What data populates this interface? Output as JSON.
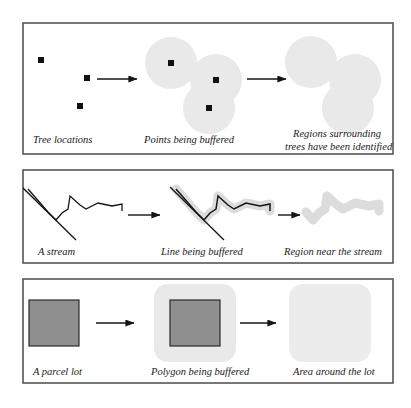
{
  "figure": {
    "frame_color": "#555555",
    "buffer_fill": "#e9e9e9",
    "parcel_fill": "#8f8f8f",
    "ink_color": "#1a1a1a",
    "background": "#ffffff"
  },
  "panels": [
    {
      "id": "point-buffer",
      "name": "Point buffer row",
      "stages": [
        {
          "id": "tree-locations",
          "caption": "Tree locations",
          "caption_lines": [
            "Tree locations"
          ],
          "feature_type": "point",
          "points": [
            {
              "x": 41,
              "y": 60,
              "size": 6
            },
            {
              "x": 87,
              "y": 78,
              "size": 6
            },
            {
              "x": 80,
              "y": 106,
              "size": 6
            }
          ]
        },
        {
          "id": "points-being-buffered",
          "caption": "Points being buffered",
          "caption_lines": [
            "Points being buffered"
          ],
          "feature_type": "point-with-buffer",
          "buffer_radius": 26,
          "points": [
            {
              "x": 171,
              "y": 63,
              "size": 6
            },
            {
              "x": 216,
              "y": 80,
              "size": 6
            },
            {
              "x": 209,
              "y": 108,
              "size": 6
            }
          ]
        },
        {
          "id": "regions-surrounding-trees",
          "caption": "Regions surrounding trees have been identified",
          "caption_lines": [
            "Regions surrounding",
            "trees have been identified"
          ],
          "feature_type": "buffer-only",
          "buffer_radius": 26,
          "points": [
            {
              "x": 311,
              "y": 62,
              "size": 0
            },
            {
              "x": 355,
              "y": 80,
              "size": 0
            },
            {
              "x": 348,
              "y": 108,
              "size": 0
            }
          ]
        }
      ],
      "arrows": [
        {
          "x1": 97,
          "y1": 79,
          "x2": 137,
          "y2": 79
        },
        {
          "x1": 247,
          "y1": 79,
          "x2": 286,
          "y2": 79
        }
      ]
    },
    {
      "id": "line-buffer",
      "name": "Line buffer row",
      "stages": [
        {
          "id": "a-stream",
          "caption": "A stream",
          "caption_lines": [
            "A stream"
          ],
          "feature_type": "line",
          "main_line": "28,189 48,212 56,220 62,213 68,209 70,196 80,205 86,209 98,203 112,206 122,204 122,211",
          "branch_line": "22,187 76,240"
        },
        {
          "id": "line-being-buffered",
          "caption": "Line being buffered",
          "caption_lines": [
            "Line being buffered"
          ],
          "feature_type": "line-with-buffer",
          "buffer_width": 9,
          "main_line": "176,189 196,212 204,220 210,213 216,209 218,196 228,205 234,209 246,203 260,206 270,204 270,211",
          "branch_line": "170,187 224,240"
        },
        {
          "id": "region-near-stream",
          "caption": "Region near the stream",
          "caption_lines": [
            "Region near the stream"
          ],
          "feature_type": "buffer-only-line",
          "buffer_width": 9,
          "main_line": "306,212 313,220 319,213 325,209 327,196 337,205 343,209 355,203 369,206 379,204 379,211"
        }
      ],
      "arrows": [
        {
          "x1": 128,
          "y1": 215,
          "x2": 160,
          "y2": 215
        },
        {
          "x1": 278,
          "y1": 215,
          "x2": 300,
          "y2": 215
        }
      ]
    },
    {
      "id": "polygon-buffer",
      "name": "Polygon buffer row",
      "stages": [
        {
          "id": "a-parcel-lot",
          "caption": "A parcel lot",
          "caption_lines": [
            "A parcel lot"
          ],
          "feature_type": "polygon",
          "rect": {
            "x": 29,
            "y": 300,
            "w": 50,
            "h": 46
          }
        },
        {
          "id": "polygon-being-buffered",
          "caption": "Polygon being buffered",
          "caption_lines": [
            "Polygon being buffered"
          ],
          "feature_type": "polygon-with-buffer",
          "rect": {
            "x": 170,
            "y": 300,
            "w": 50,
            "h": 46
          },
          "buffer_pad": 16,
          "buffer_radius": 14
        },
        {
          "id": "area-around-the-lot",
          "caption": "Area around the lot",
          "caption_lines": [
            "Area around the lot"
          ],
          "feature_type": "buffer-only-polygon",
          "rect": {
            "x": 305,
            "y": 300,
            "w": 50,
            "h": 46
          },
          "buffer_pad": 16,
          "buffer_radius": 14
        }
      ],
      "arrows": [
        {
          "x1": 96,
          "y1": 323,
          "x2": 134,
          "y2": 323
        },
        {
          "x1": 240,
          "y1": 323,
          "x2": 276,
          "y2": 323
        }
      ]
    }
  ]
}
